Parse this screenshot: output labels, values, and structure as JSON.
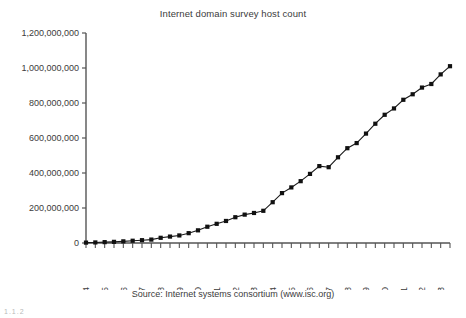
{
  "chart_title": "Internet domain survey host count",
  "source_note": "Source: Internet systems consortium (www.isc.org)",
  "bottom_artifact": "1.1.2",
  "axis": {
    "y_tick_labels": [
      "0",
      "200,000,000",
      "400,000,000",
      "600,000,000",
      "800,000,000",
      "1,000,000,000",
      "1,200,000,000"
    ],
    "x_tick_labels": [
      "Jan-94",
      "Jan-95",
      "Jan-96",
      "Jan-97",
      "Jan-98",
      "Jan-99",
      "Jan-00",
      "Jan-01",
      "Jan-02",
      "Jan-03",
      "Jan-04",
      "Jan-05",
      "Jan-06",
      "Jan-07",
      "Jan-08",
      "Jan-09",
      "Jan-10",
      "Jan-11",
      "Jan-12",
      "Jan-13"
    ]
  },
  "style": {
    "line_color": "#1a1a1a",
    "marker_color": "#111111",
    "axis_color": "#555555",
    "text_color": "#3b3b3b",
    "background": "#ffffff"
  },
  "chart_data": {
    "type": "line",
    "title": "Internet domain survey host count",
    "xlabel": "",
    "ylabel": "",
    "ylim": [
      0,
      1200000000
    ],
    "grid": false,
    "legend": "none",
    "marker": "square",
    "x_tick_labels": [
      "Jan-94",
      "Jan-95",
      "Jan-96",
      "Jan-97",
      "Jan-98",
      "Jan-99",
      "Jan-00",
      "Jan-01",
      "Jan-02",
      "Jan-03",
      "Jan-04",
      "Jan-05",
      "Jan-06",
      "Jan-07",
      "Jan-08",
      "Jan-09",
      "Jan-10",
      "Jan-11",
      "Jan-12",
      "Jan-13"
    ],
    "y_tick_values": [
      0,
      200000000,
      400000000,
      600000000,
      800000000,
      1000000000,
      1200000000
    ],
    "x": [
      "Jan-94",
      "Jul-94",
      "Jan-95",
      "Jul-95",
      "Jan-96",
      "Jul-96",
      "Jan-97",
      "Jul-97",
      "Jan-98",
      "Jul-98",
      "Jan-99",
      "Jul-99",
      "Jan-00",
      "Jul-00",
      "Jan-01",
      "Jul-01",
      "Jan-02",
      "Jul-02",
      "Jan-03",
      "Jul-03",
      "Jan-04",
      "Jul-04",
      "Jan-05",
      "Jul-05",
      "Jan-06",
      "Jul-06",
      "Jan-07",
      "Jul-07",
      "Jan-08",
      "Jul-08",
      "Jan-09",
      "Jul-09",
      "Jan-10",
      "Jul-10",
      "Jan-11",
      "Jul-11",
      "Jan-12",
      "Jul-12",
      "Jan-13",
      "Jul-13"
    ],
    "values": [
      2200000,
      3200000,
      4900000,
      6600000,
      9500000,
      12900000,
      16100000,
      19500000,
      29700000,
      36700000,
      43200000,
      56200000,
      72400000,
      93000000,
      109600000,
      125900000,
      147300000,
      162100000,
      171600000,
      184000000,
      233100000,
      285100000,
      317600000,
      353300000,
      394900000,
      439300000,
      433200000,
      489800000,
      541700000,
      570900000,
      625200000,
      681600000,
      732700000,
      768900000,
      818400000,
      849900000,
      888200000,
      908600000,
      963500000,
      1010300000
    ],
    "series": [
      {
        "name": "Host count",
        "values": [
          2200000,
          3200000,
          4900000,
          6600000,
          9500000,
          12900000,
          16100000,
          19500000,
          29700000,
          36700000,
          43200000,
          56200000,
          72400000,
          93000000,
          109600000,
          125900000,
          147300000,
          162100000,
          171600000,
          184000000,
          233100000,
          285100000,
          317600000,
          353300000,
          394900000,
          439300000,
          433200000,
          489800000,
          541700000,
          570900000,
          625200000,
          681600000,
          732700000,
          768900000,
          818400000,
          849900000,
          888200000,
          908600000,
          963500000,
          1010300000
        ]
      }
    ]
  }
}
